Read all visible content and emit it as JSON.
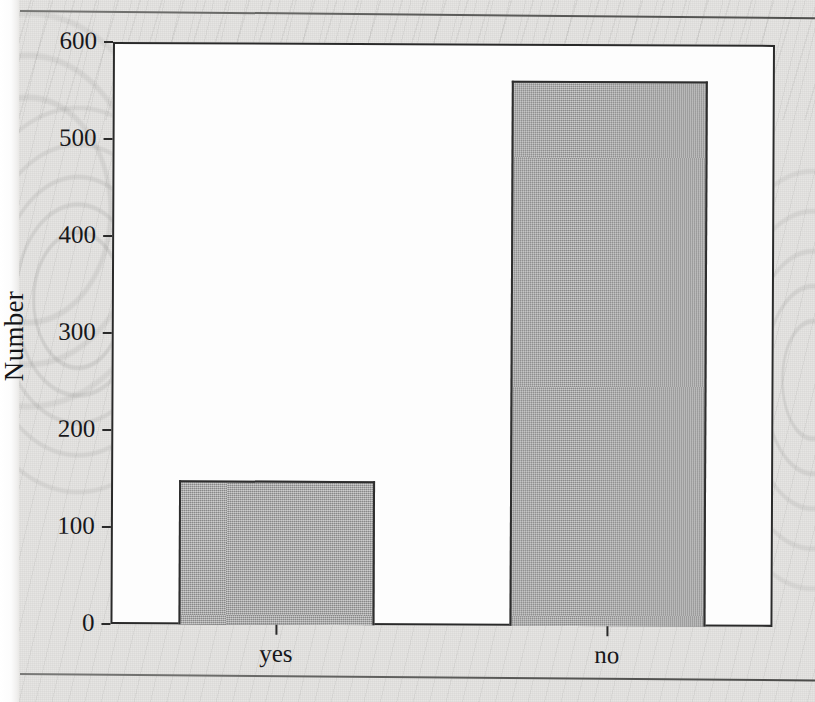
{
  "page": {
    "background_color": "#e4e3e1",
    "rule_color": "#5d5d5b",
    "has_top_rule": true,
    "has_bottom_rule": true
  },
  "chart_data": {
    "type": "bar",
    "title": "",
    "subtitle": "",
    "xlabel": "",
    "ylabel": "Number",
    "categories": [
      "yes",
      "no"
    ],
    "values": [
      148,
      562
    ],
    "series": [
      {
        "name": "Number",
        "values": [
          148,
          562
        ]
      }
    ],
    "ylim": [
      0,
      600
    ],
    "yticks": [
      0,
      100,
      200,
      300,
      400,
      500,
      600
    ],
    "ytick_labels": [
      "0",
      "100",
      "200",
      "300",
      "400",
      "500",
      "600"
    ],
    "xtick_labels": [
      "yes",
      "no"
    ],
    "grid": false,
    "legend": false,
    "legend_position": "none",
    "bar_fill_color": "#9c9c9c",
    "bar_edge_color": "#2e2e2e",
    "plot_background_color": "#fdfdfd",
    "axis_color": "#2a2a2a",
    "annotations": []
  }
}
